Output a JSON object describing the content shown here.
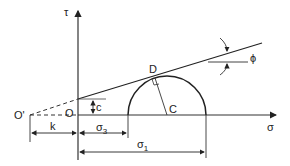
{
  "diagram": {
    "axes": {
      "y_label": "τ",
      "x_label": "σ"
    },
    "points": {
      "origin_prime": "O'",
      "origin": "O",
      "tangent_point": "D",
      "center": "C"
    },
    "labels": {
      "cohesion": "c",
      "angle": "ϕ",
      "offset": "k",
      "sigma3": "σ",
      "sigma3_sub": "3",
      "sigma1": "σ",
      "sigma1_sub": "1"
    }
  }
}
